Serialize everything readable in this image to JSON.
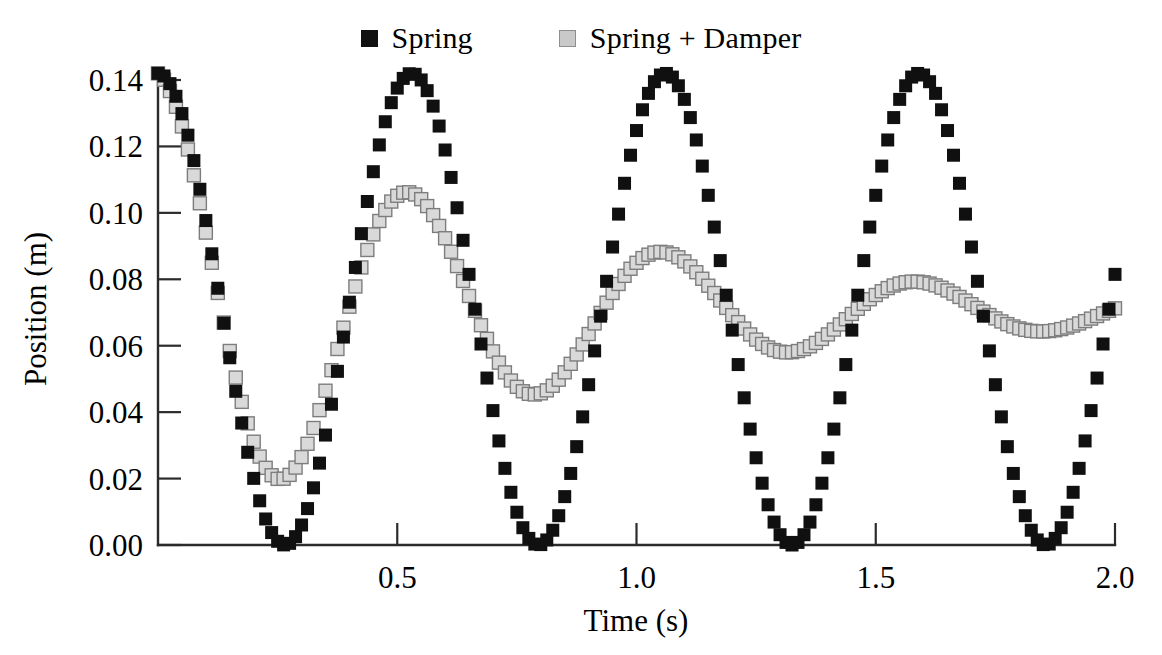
{
  "legend": {
    "position": "top-center",
    "entries": [
      {
        "label": "Spring",
        "marker": "filled-square",
        "color": "#101010"
      },
      {
        "label": "Spring + Damper",
        "marker": "filled-square",
        "color": "#d9d9d9"
      }
    ]
  },
  "axes": {
    "x": {
      "title": "Time (s)",
      "ticks": [
        "0.5",
        "1.0",
        "1.5",
        "2.0"
      ],
      "tick_values": [
        0.5,
        1.0,
        1.5,
        2.0
      ],
      "range": [
        0.0,
        2.0
      ]
    },
    "y": {
      "title": "Position (m)",
      "ticks": [
        "0.00",
        "0.02",
        "0.04",
        "0.06",
        "0.08",
        "0.10",
        "0.12",
        "0.14"
      ],
      "tick_values": [
        0.0,
        0.02,
        0.04,
        0.06,
        0.08,
        0.1,
        0.12,
        0.14
      ],
      "range": [
        0.0,
        0.15
      ]
    }
  },
  "chart_data": {
    "type": "scatter",
    "title": "",
    "xlabel": "Time (s)",
    "ylabel": "Position (m)",
    "xlim": [
      0.0,
      2.0
    ],
    "ylim": [
      0.0,
      0.15
    ],
    "grid": false,
    "legend_position": "top-center",
    "marker": "square",
    "series": [
      {
        "name": "Spring",
        "color": "#101010",
        "model": "undamped_cosine",
        "equilibrium": 0.071,
        "amplitude": 0.071,
        "period": 0.53,
        "phase_t0": 0.0,
        "damping_ratio": 0.0,
        "n_points": 160,
        "key_points": [
          {
            "t": 0.0,
            "y": 0.142
          },
          {
            "t": 0.265,
            "y": 0.0
          },
          {
            "t": 0.53,
            "y": 0.142
          },
          {
            "t": 0.795,
            "y": 0.0
          },
          {
            "t": 1.06,
            "y": 0.142
          },
          {
            "t": 1.325,
            "y": 0.0
          },
          {
            "t": 1.59,
            "y": 0.142
          },
          {
            "t": 1.855,
            "y": 0.0
          },
          {
            "t": 2.0,
            "y": 0.082
          }
        ]
      },
      {
        "name": "Spring + Damper",
        "color": "#d9d9d9",
        "edge_color": "#7d7d7d",
        "model": "damped_cosine",
        "equilibrium": 0.0705,
        "amplitude": 0.0715,
        "period": 0.53,
        "decay_constant_per_s": 1.32,
        "damping_ratio": 0.11,
        "n_points": 160,
        "key_points": [
          {
            "t": 0.0,
            "y": 0.142
          },
          {
            "t": 0.27,
            "y": 0.023
          },
          {
            "t": 0.535,
            "y": 0.101
          },
          {
            "t": 0.79,
            "y": 0.049
          },
          {
            "t": 1.06,
            "y": 0.084
          },
          {
            "t": 1.325,
            "y": 0.06
          },
          {
            "t": 1.59,
            "y": 0.076
          },
          {
            "t": 1.855,
            "y": 0.065
          },
          {
            "t": 2.0,
            "y": 0.07
          }
        ]
      }
    ]
  }
}
